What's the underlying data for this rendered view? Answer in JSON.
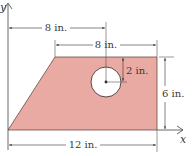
{
  "diagram": {
    "axes": {
      "x_label": "x",
      "y_label": "y"
    },
    "shape": {
      "fill_color": "#e8aaa2",
      "stroke_color": "#5a3a36",
      "hole_fill": "#ffffff"
    },
    "dimensions": {
      "top_offset": "8 in.",
      "top_width": "8 in.",
      "hole_offset": "2 in.",
      "height": "6 in.",
      "bottom_width": "12 in."
    }
  }
}
